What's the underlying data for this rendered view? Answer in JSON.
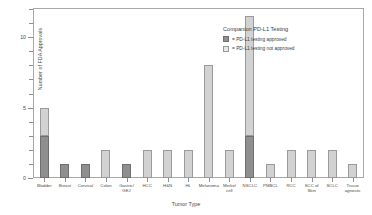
{
  "chart_data": {
    "type": "bar",
    "subtype": "stacked-bar",
    "title": "",
    "xlabel": "Tumor Type",
    "ylabel": "Number of FDA Approvals",
    "ylim": [
      0,
      12
    ],
    "ymajor_ticks": [
      0,
      5,
      10
    ],
    "ytick_labels": [
      "0",
      "5",
      "10"
    ],
    "yminor_ticks": [
      1,
      2,
      3,
      4,
      6,
      7,
      8,
      9,
      11,
      12
    ],
    "grid": false,
    "legend_position": "top-right-inside",
    "categories": [
      "Bladder",
      "Breast",
      "Cervical",
      "Colon",
      "Gastric/ GEJ",
      "HCC",
      "H&N",
      "HL",
      "Melanoma",
      "Merkel cell",
      "NSCLC",
      "PMBCL",
      "RCC",
      "SCC of Skin",
      "SCLC",
      "Tissue agnostic"
    ],
    "category_lines": [
      [
        "Bladder"
      ],
      [
        "Breast"
      ],
      [
        "Cervical"
      ],
      [
        "Colon"
      ],
      [
        "Gastric/",
        "GEJ"
      ],
      [
        "HCC"
      ],
      [
        "H&N"
      ],
      [
        "HL"
      ],
      [
        "Melanoma"
      ],
      [
        "Merkel",
        "cell"
      ],
      [
        "NSCLC"
      ],
      [
        "PMBCL"
      ],
      [
        "RCC"
      ],
      [
        "SCC of",
        "Skin"
      ],
      [
        "SCLC"
      ],
      [
        "Tissue",
        "agnostic"
      ]
    ],
    "series": [
      {
        "name": "= PD-L1 testing approved",
        "key": "approved",
        "color": "#8f8f8f",
        "values": [
          3,
          1,
          1,
          0,
          1,
          0,
          0,
          0,
          0,
          0,
          3,
          0,
          0,
          0,
          0,
          0
        ]
      },
      {
        "name": "= PD-L1 testing not approved",
        "key": "not_approved",
        "color": "#d2d2d2",
        "values": [
          2,
          0,
          0,
          2,
          0,
          2,
          2,
          2,
          8,
          2,
          8.5,
          1,
          2,
          2,
          2,
          1
        ]
      }
    ],
    "totals": [
      5,
      1,
      1,
      2,
      1,
      2,
      2,
      2,
      8,
      2,
      11.5,
      1,
      2,
      2,
      2,
      1
    ]
  },
  "legend": {
    "title": "Companion PD-L1 Testing",
    "entries": [
      {
        "label": "= PD-L1 testing approved",
        "swatch": "approved"
      },
      {
        "label": "= PD-L1 testing not approved",
        "swatch": "notapproved"
      }
    ]
  }
}
